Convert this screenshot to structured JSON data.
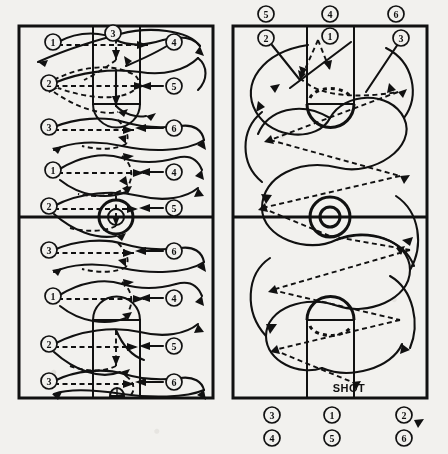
{
  "figure": {
    "type": "basketball-play-diagram",
    "panels": [
      {
        "id": "left-panel",
        "name": "three-lane-weave-drill-court",
        "court": {
          "half_lines": 1,
          "keys": [
            "top-key",
            "bottom-key"
          ],
          "center_circle": true
        },
        "rows": [
          {
            "row": 1,
            "left_marker": "1",
            "center_marker": "3",
            "right_marker": "4"
          },
          {
            "row": 2,
            "left_marker": "2",
            "center_marker": "",
            "right_marker": "5"
          },
          {
            "row": 3,
            "left_marker": "3",
            "center_marker": "",
            "right_marker": "6"
          },
          {
            "row": 4,
            "left_marker": "1",
            "center_marker": "",
            "right_marker": "4"
          },
          {
            "row": 5,
            "left_marker": "2",
            "center_marker": "",
            "right_marker": "5"
          },
          {
            "row": 6,
            "left_marker": "3",
            "center_marker": "",
            "right_marker": "6"
          },
          {
            "row": 7,
            "left_marker": "1",
            "center_marker": "",
            "right_marker": "4"
          },
          {
            "row": 8,
            "left_marker": "2",
            "center_marker": "",
            "right_marker": "5"
          },
          {
            "row": 9,
            "left_marker": "3",
            "center_marker": "",
            "right_marker": "6"
          }
        ]
      },
      {
        "id": "right-panel",
        "name": "full-court-weave-to-shot",
        "court": {
          "half_lines": 1,
          "keys": [
            "top-key",
            "bottom-key"
          ],
          "center_circle": true
        },
        "top_outside_markers": [
          "5",
          "4",
          "6"
        ],
        "top_inside_markers": [
          "2",
          "1",
          "3"
        ],
        "bottom_markers_row1": [
          "3",
          "1",
          "2"
        ],
        "bottom_markers_row2": [
          "4",
          "5",
          "6"
        ],
        "annotation": "SHOT"
      }
    ],
    "legend": {
      "solid_line": "player movement",
      "dashed_line": "pass"
    },
    "colors": {
      "ink": "#111111",
      "paper": "#f2f1ee"
    }
  }
}
